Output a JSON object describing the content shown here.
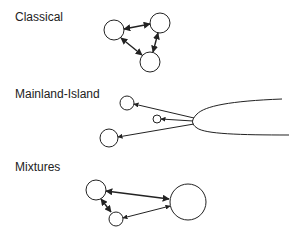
{
  "panels": [
    {
      "id": "classical",
      "label": "Classical"
    },
    {
      "id": "mainland-island",
      "label": "Mainland-Island"
    },
    {
      "id": "mixtures",
      "label": "Mixtures"
    }
  ],
  "colors": {
    "stroke": "#222222",
    "background": "#ffffff"
  }
}
